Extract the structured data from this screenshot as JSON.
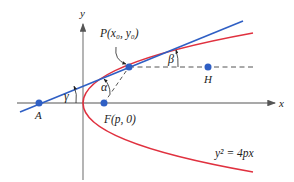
{
  "diagram": {
    "axes": {
      "x_label": "x",
      "y_label": "y"
    },
    "points": {
      "P": "P(x₀, y₀)",
      "F": "F(p, 0)",
      "A": "A",
      "H": "H"
    },
    "angles": {
      "alpha": "α",
      "beta": "β",
      "gamma": "γ"
    },
    "curve_label": "y² = 4px",
    "colors": {
      "tangent": "#2f5fc4",
      "parabola": "#e0313f",
      "point": "#2f5fc4",
      "axis": "#555555",
      "dashed": "#555555"
    }
  }
}
